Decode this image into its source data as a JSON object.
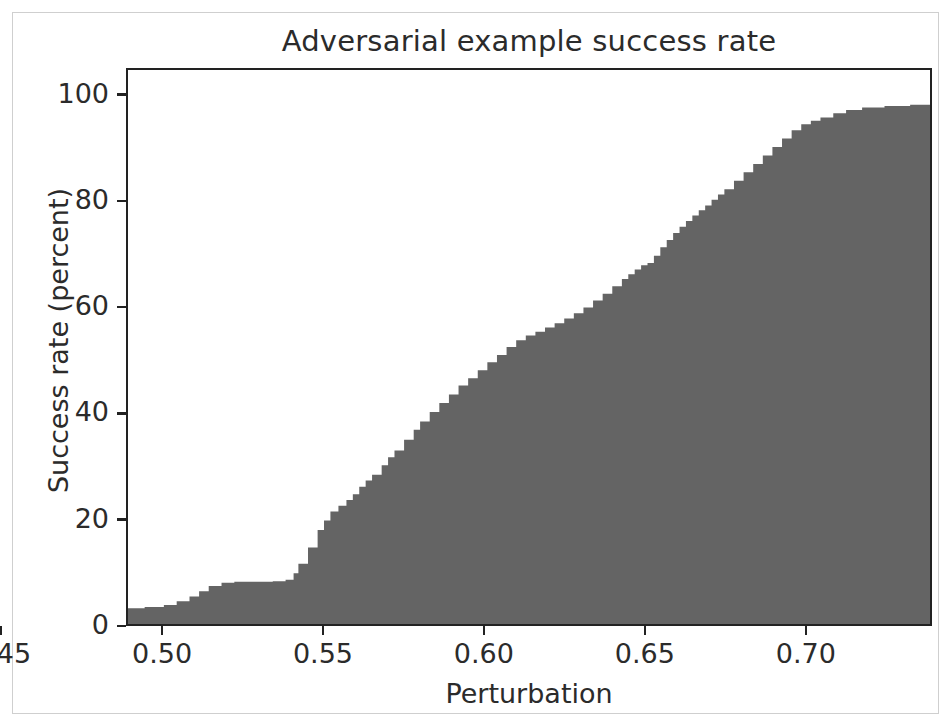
{
  "chart_data": {
    "type": "area",
    "title": "Adversarial example success rate",
    "xlabel": "Perturbation",
    "ylabel": "Success rate (percent)",
    "xlim": [
      0.4888,
      0.7392
    ],
    "ylim": [
      0,
      105
    ],
    "xticks": [
      0.45,
      0.5,
      0.55,
      0.6,
      0.65,
      0.7
    ],
    "xtick_labels": [
      "0.45",
      "0.50",
      "0.55",
      "0.60",
      "0.65",
      "0.70"
    ],
    "yticks": [
      0,
      20,
      40,
      60,
      80,
      100
    ],
    "ytick_labels": [
      "0",
      "20",
      "40",
      "60",
      "80",
      "100"
    ],
    "grid": false,
    "legend": false,
    "fill_color": "#646464",
    "axis_color": "#222222",
    "text_color": "#2b2b2b",
    "frame_color": "#cfcfcf",
    "background_color": "#ffffff",
    "series_name": "Cumulative success rate",
    "x": [
      0.437,
      0.445,
      0.449,
      0.4505,
      0.453,
      0.456,
      0.459,
      0.462,
      0.465,
      0.47,
      0.476,
      0.482,
      0.488,
      0.494,
      0.5,
      0.504,
      0.508,
      0.511,
      0.514,
      0.518,
      0.522,
      0.526,
      0.53,
      0.534,
      0.538,
      0.5405,
      0.542,
      0.545,
      0.548,
      0.55,
      0.552,
      0.5545,
      0.557,
      0.559,
      0.561,
      0.563,
      0.565,
      0.568,
      0.57,
      0.572,
      0.575,
      0.578,
      0.58,
      0.583,
      0.586,
      0.589,
      0.592,
      0.595,
      0.598,
      0.601,
      0.604,
      0.607,
      0.61,
      0.613,
      0.616,
      0.619,
      0.622,
      0.625,
      0.628,
      0.631,
      0.634,
      0.637,
      0.64,
      0.643,
      0.645,
      0.647,
      0.649,
      0.651,
      0.653,
      0.655,
      0.657,
      0.659,
      0.661,
      0.663,
      0.665,
      0.667,
      0.669,
      0.671,
      0.673,
      0.675,
      0.678,
      0.681,
      0.684,
      0.687,
      0.69,
      0.693,
      0.696,
      0.699,
      0.702,
      0.705,
      0.709,
      0.713,
      0.718,
      0.725,
      0.733,
      0.7392
    ],
    "y": [
      0.0,
      0.0,
      0.3,
      0.6,
      1.0,
      1.6,
      2.4,
      2.9,
      3.0,
      3.0,
      3.0,
      3.0,
      3.0,
      3.2,
      3.6,
      4.3,
      5.2,
      6.2,
      7.2,
      7.8,
      8.0,
      8.0,
      8.0,
      8.1,
      8.4,
      9.6,
      11.4,
      14.5,
      17.8,
      19.6,
      21.3,
      22.4,
      23.5,
      24.6,
      26.0,
      27.2,
      28.3,
      30.1,
      31.6,
      32.9,
      34.9,
      36.8,
      38.4,
      40.2,
      41.9,
      43.5,
      45.2,
      46.6,
      48.1,
      49.6,
      51.0,
      52.5,
      53.8,
      54.7,
      55.4,
      56.2,
      57.0,
      57.9,
      58.9,
      60.0,
      61.3,
      62.6,
      64.0,
      65.4,
      66.3,
      67.2,
      68.0,
      68.4,
      69.8,
      71.4,
      72.8,
      74.1,
      75.3,
      76.4,
      77.4,
      78.4,
      79.3,
      80.4,
      81.4,
      82.4,
      84.0,
      85.6,
      87.2,
      88.8,
      90.4,
      92.0,
      93.6,
      94.7,
      95.4,
      96.0,
      96.8,
      97.4,
      97.9,
      98.2,
      98.4,
      98.5
    ]
  },
  "figure": {
    "title": "Adversarial example success rate",
    "xlabel": "Perturbation",
    "ylabel": "Success rate (percent)"
  }
}
